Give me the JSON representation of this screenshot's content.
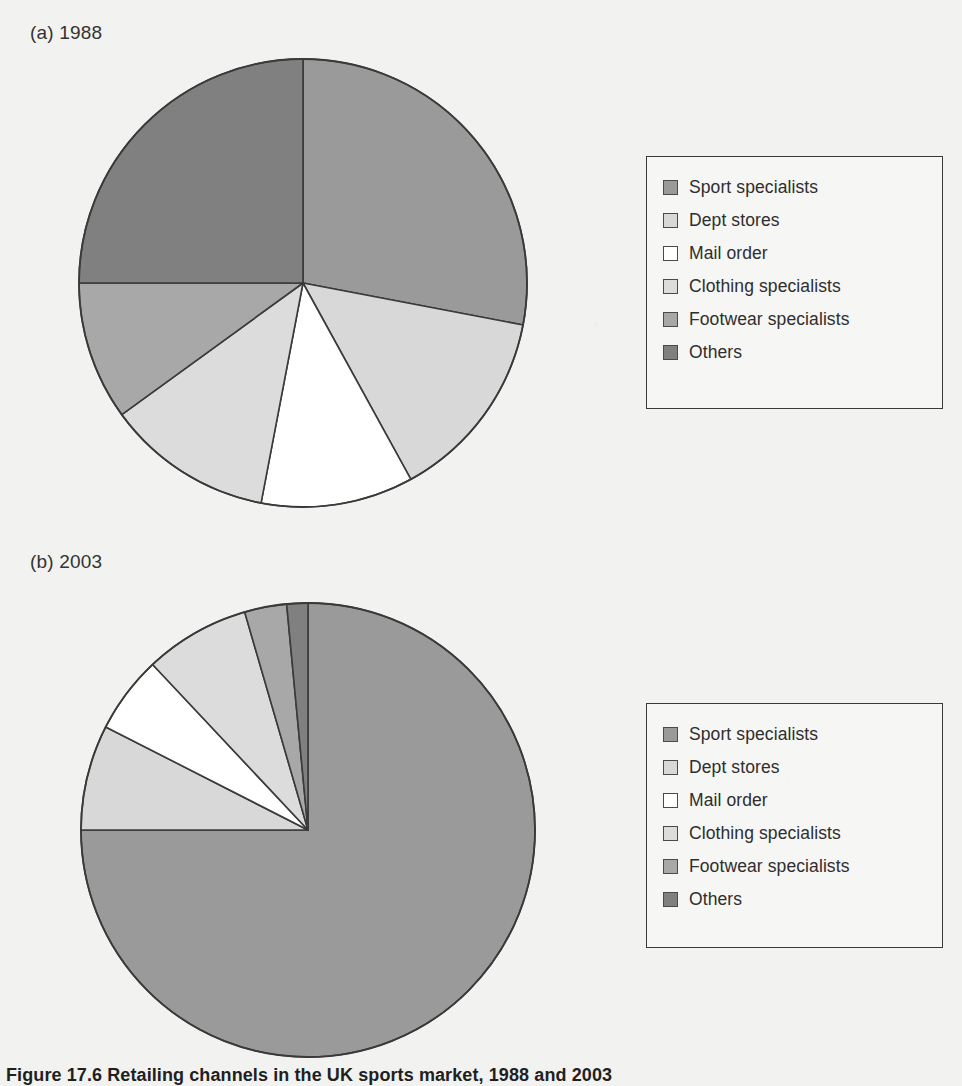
{
  "figure": {
    "caption": "Figure 17.6 Retailing channels in the UK sports market, 1988 and 2003"
  },
  "palette": {
    "sport_specialists": "#9a9a9a",
    "dept_stores": "#d8d8d8",
    "mail_order": "#ffffff",
    "clothing_specialists": "#dcdcdc",
    "footwear_specialists": "#a8a8a8",
    "others": "#808080",
    "outline": "#3a3a3a",
    "paper": "#f2f2f0"
  },
  "panels": [
    {
      "id": "panel-a",
      "label": "(a) 1988",
      "legend": {
        "items": [
          {
            "label": "Sport specialists",
            "swatch": "#9a9a9a",
            "icon": "legend-swatch-icon"
          },
          {
            "label": "Dept stores",
            "swatch": "#d8d8d8",
            "icon": "legend-swatch-icon"
          },
          {
            "label": "Mail order",
            "swatch": "#ffffff",
            "icon": "legend-swatch-icon"
          },
          {
            "label": "Clothing specialists",
            "swatch": "#dcdcdc",
            "icon": "legend-swatch-icon"
          },
          {
            "label": "Footwear specialists",
            "swatch": "#a8a8a8",
            "icon": "legend-swatch-icon"
          },
          {
            "label": "Others",
            "swatch": "#808080",
            "icon": "legend-swatch-icon"
          }
        ]
      }
    },
    {
      "id": "panel-b",
      "label": "(b) 2003",
      "legend": {
        "items": [
          {
            "label": "Sport specialists",
            "swatch": "#9a9a9a",
            "icon": "legend-swatch-icon"
          },
          {
            "label": "Dept stores",
            "swatch": "#d8d8d8",
            "icon": "legend-swatch-icon"
          },
          {
            "label": "Mail order",
            "swatch": "#ffffff",
            "icon": "legend-swatch-icon"
          },
          {
            "label": "Clothing specialists",
            "swatch": "#dcdcdc",
            "icon": "legend-swatch-icon"
          },
          {
            "label": "Footwear specialists",
            "swatch": "#a8a8a8",
            "icon": "legend-swatch-icon"
          },
          {
            "label": "Others",
            "swatch": "#808080",
            "icon": "legend-swatch-icon"
          }
        ]
      }
    }
  ],
  "chart_data": [
    {
      "type": "pie",
      "id": "pie-1988",
      "title": "(a) 1988",
      "labels": [
        "Sport specialists",
        "Dept stores",
        "Mail order",
        "Clothing specialists",
        "Footwear specialists",
        "Others"
      ],
      "values": [
        28,
        14,
        11,
        12,
        10,
        25
      ],
      "unit": "percent",
      "start_angle_deg": 0,
      "direction": "clockwise",
      "colors": [
        "#9a9a9a",
        "#d8d8d8",
        "#ffffff",
        "#dcdcdc",
        "#a8a8a8",
        "#808080"
      ],
      "legend_position": "right",
      "center": {
        "x": 303,
        "y": 283
      },
      "radius": 224
    },
    {
      "type": "pie",
      "id": "pie-2003",
      "title": "(b) 2003",
      "labels": [
        "Sport specialists",
        "Dept stores",
        "Mail order",
        "Clothing specialists",
        "Footwear specialists",
        "Others"
      ],
      "values": [
        75,
        7.5,
        5.5,
        7.5,
        3,
        1.5
      ],
      "unit": "percent",
      "start_angle_deg": 0,
      "direction": "clockwise",
      "colors": [
        "#9a9a9a",
        "#d8d8d8",
        "#ffffff",
        "#dcdcdc",
        "#a8a8a8",
        "#808080"
      ],
      "legend_position": "right",
      "center": {
        "x": 308,
        "y": 830
      },
      "radius": 227
    }
  ]
}
